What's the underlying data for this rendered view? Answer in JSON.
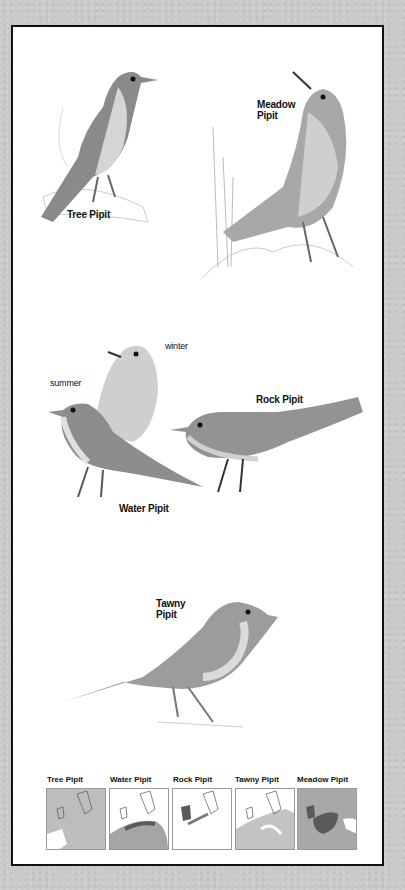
{
  "plate": {
    "birds": [
      {
        "id": "tree-pipit",
        "label": "Tree Pipit"
      },
      {
        "id": "meadow-pipit",
        "label_line1": "Meadow",
        "label_line2": "Pipit"
      },
      {
        "id": "water-pipit",
        "label": "Water Pipit",
        "variants": {
          "winter": "winter",
          "summer": "summer"
        }
      },
      {
        "id": "rock-pipit",
        "label": "Rock Pipit"
      },
      {
        "id": "tawny-pipit",
        "label_line1": "Tawny",
        "label_line2": "Pipit"
      }
    ],
    "maps": [
      {
        "title": "Tree Pipit"
      },
      {
        "title": "Water Pipit"
      },
      {
        "title": "Rock Pipit"
      },
      {
        "title": "Tawny Pipit"
      },
      {
        "title": "Meadow Pipit"
      }
    ]
  },
  "colors": {
    "background": "#c9c9c9",
    "panel": "#ffffff",
    "border": "#111111",
    "bird_dark": "#6e6e6e",
    "bird_mid": "#9a9a9a",
    "bird_light": "#d8d8d8",
    "range_light": "#bdbdbd",
    "range_dark": "#5a5a5a"
  }
}
